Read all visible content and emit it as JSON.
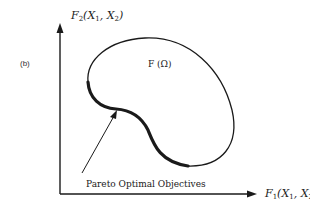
{
  "figure": {
    "panel_label": "(b)",
    "y_axis": {
      "label_main": "F",
      "label_sub": "2",
      "label_args": "(X",
      "arg1_sub": "1",
      "arg_sep": ", X",
      "arg2_sub": "2",
      "label_close": ")"
    },
    "x_axis": {
      "label_main": "F",
      "label_sub": "1",
      "label_args": "(X",
      "arg1_sub": "1",
      "arg_sep": ", X",
      "arg2_sub": "2",
      "label_close": ")"
    },
    "region_label": "F (Ω)",
    "annotation": "Pareto Optimal Objectives",
    "colors": {
      "ink": "#1a1a1a",
      "background": "#ffffff"
    }
  }
}
